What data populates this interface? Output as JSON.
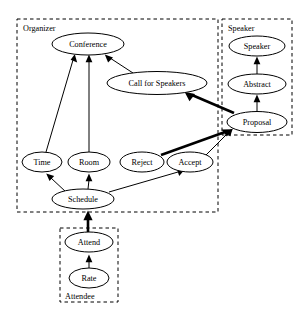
{
  "diagram": {
    "type": "directed-graph",
    "title": "",
    "background_color": "#ffffff",
    "line_color": "#000000",
    "clusters": [
      {
        "id": "organizer",
        "label": "Organizer",
        "label_position": "top-left",
        "x": 17,
        "y": 19,
        "width": 201,
        "height": 193,
        "style": "dashed"
      },
      {
        "id": "speaker",
        "label": "Speaker",
        "label_position": "top-left",
        "x": 222,
        "y": 19,
        "width": 70,
        "height": 116,
        "style": "dashed"
      },
      {
        "id": "attendee",
        "label": "Attendee",
        "label_position": "bottom-left",
        "x": 60,
        "y": 228,
        "width": 58,
        "height": 74,
        "style": "dashed"
      }
    ],
    "nodes": [
      {
        "id": "conference",
        "label": "Conference",
        "cluster": "organizer",
        "cx": 88,
        "cy": 44,
        "rx": 36,
        "ry": 11
      },
      {
        "id": "call_for_speakers",
        "label": "Call for Speakers",
        "cluster": "organizer",
        "cx": 157,
        "cy": 83,
        "rx": 50,
        "ry": 11.5
      },
      {
        "id": "time",
        "label": "Time",
        "cluster": "organizer",
        "cx": 42,
        "cy": 162,
        "rx": 20,
        "ry": 10
      },
      {
        "id": "room",
        "label": "Room",
        "cluster": "organizer",
        "cx": 89,
        "cy": 162,
        "rx": 21,
        "ry": 10
      },
      {
        "id": "reject",
        "label": "Reject",
        "cluster": "organizer",
        "cx": 142,
        "cy": 162,
        "rx": 22,
        "ry": 10
      },
      {
        "id": "accept",
        "label": "Accept",
        "cluster": "organizer",
        "cx": 190,
        "cy": 162,
        "rx": 23,
        "ry": 10
      },
      {
        "id": "schedule",
        "label": "Schedule",
        "cluster": "organizer",
        "cx": 83,
        "cy": 199,
        "rx": 31,
        "ry": 10
      },
      {
        "id": "speaker_node",
        "label": "Speaker",
        "cluster": "speaker",
        "cx": 257,
        "cy": 46,
        "rx": 28,
        "ry": 10
      },
      {
        "id": "abstract",
        "label": "Abstract",
        "cluster": "speaker",
        "cx": 257,
        "cy": 84,
        "rx": 29,
        "ry": 10
      },
      {
        "id": "proposal",
        "label": "Proposal",
        "cluster": "speaker",
        "cx": 257,
        "cy": 122,
        "rx": 30,
        "ry": 10.5
      },
      {
        "id": "attend",
        "label": "Attend",
        "cluster": "attendee",
        "cx": 89,
        "cy": 242,
        "rx": 24,
        "ry": 10
      },
      {
        "id": "rate",
        "label": "Rate",
        "cluster": "attendee",
        "cx": 89,
        "cy": 278,
        "rx": 20,
        "ry": 10
      }
    ],
    "edges": [
      {
        "from": "time",
        "to": "conference",
        "weight": "thin"
      },
      {
        "from": "room",
        "to": "conference",
        "weight": "thin"
      },
      {
        "from": "call_for_speakers",
        "to": "conference",
        "weight": "thin"
      },
      {
        "from": "proposal",
        "to": "call_for_speakers",
        "weight": "thick"
      },
      {
        "from": "abstract",
        "to": "speaker_node",
        "weight": "thin"
      },
      {
        "from": "proposal",
        "to": "abstract",
        "weight": "thin"
      },
      {
        "from": "reject",
        "to": "proposal",
        "weight": "thick"
      },
      {
        "from": "accept",
        "to": "proposal",
        "weight": "thin"
      },
      {
        "from": "schedule",
        "to": "time",
        "weight": "thin"
      },
      {
        "from": "schedule",
        "to": "room",
        "weight": "thin"
      },
      {
        "from": "schedule",
        "to": "accept",
        "weight": "thin"
      },
      {
        "from": "attend",
        "to": "schedule",
        "weight": "thick"
      },
      {
        "from": "rate",
        "to": "attend",
        "weight": "thin"
      }
    ]
  }
}
